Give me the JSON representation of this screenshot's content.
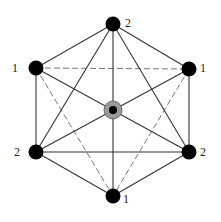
{
  "diagram": {
    "title": "",
    "colors": {
      "line": "#333333",
      "node": "#000000",
      "center_ring": "#9a9a9a",
      "center_core": "#000000",
      "label": "#222222"
    },
    "nodes": [
      {
        "id": "top",
        "label": "2",
        "x": 113,
        "y": 24
      },
      {
        "id": "ul",
        "label": "1",
        "x": 36,
        "y": 68
      },
      {
        "id": "ur",
        "label": "1",
        "x": 189,
        "y": 69
      },
      {
        "id": "ll",
        "label": "2",
        "x": 36,
        "y": 152
      },
      {
        "id": "lr",
        "label": "2",
        "x": 189,
        "y": 152
      },
      {
        "id": "bot",
        "label": "1",
        "x": 113,
        "y": 196
      },
      {
        "id": "center",
        "label": "",
        "x": 113,
        "y": 110
      }
    ],
    "edges": [
      {
        "from": "top",
        "to": "ul",
        "style": "solid"
      },
      {
        "from": "top",
        "to": "ur",
        "style": "solid"
      },
      {
        "from": "ul",
        "to": "ll",
        "style": "solid"
      },
      {
        "from": "ur",
        "to": "lr",
        "style": "solid"
      },
      {
        "from": "ll",
        "to": "bot",
        "style": "solid"
      },
      {
        "from": "lr",
        "to": "bot",
        "style": "solid"
      },
      {
        "from": "ul",
        "to": "ur",
        "style": "dashed"
      },
      {
        "from": "ll",
        "to": "lr",
        "style": "solid"
      },
      {
        "from": "ul",
        "to": "bot",
        "style": "dashed"
      },
      {
        "from": "ur",
        "to": "bot",
        "style": "dashed"
      },
      {
        "from": "top",
        "to": "ll",
        "style": "solid"
      },
      {
        "from": "top",
        "to": "lr",
        "style": "solid"
      },
      {
        "from": "top",
        "to": "bot",
        "style": "solid"
      },
      {
        "from": "ul",
        "to": "lr",
        "style": "solid"
      },
      {
        "from": "ur",
        "to": "ll",
        "style": "solid"
      }
    ],
    "labels": {
      "top": "2",
      "ul": "1",
      "ur": "1",
      "ll": "2",
      "lr": "2",
      "bot": "1"
    }
  }
}
